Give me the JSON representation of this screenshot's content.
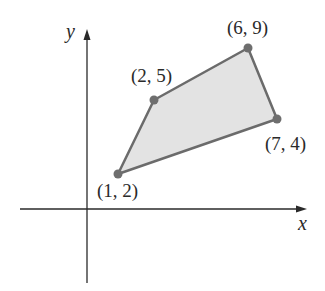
{
  "figure": {
    "type": "coordinate-plane-polygon",
    "axes": {
      "x_label": "x",
      "y_label": "y"
    },
    "polygon": {
      "fill": "#e3e3e3",
      "stroke": "#6b6b6b",
      "vertices": [
        {
          "x": 1,
          "y": 2,
          "label": "(1, 2)"
        },
        {
          "x": 2,
          "y": 5,
          "label": "(2, 5)"
        },
        {
          "x": 6,
          "y": 9,
          "label": "(6, 9)"
        },
        {
          "x": 7,
          "y": 4,
          "label": "(7, 4)"
        }
      ]
    },
    "point_color": "#6e6e6e",
    "axis_color": "#2a2a2a"
  }
}
